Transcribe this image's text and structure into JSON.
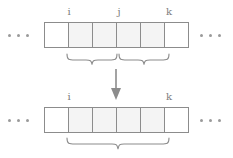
{
  "figure": {
    "stroke_color": "#8c8c8c",
    "shade_color": "#f4f4f4",
    "label_color": "#7d7d7d",
    "background": "#ffffff"
  },
  "top": {
    "ellipsis_left": "...",
    "ellipsis_right": "...",
    "labels": {
      "i": "i",
      "j": "j",
      "k": "k"
    },
    "cells": [
      {
        "shaded": false
      },
      {
        "shaded": true
      },
      {
        "shaded": true
      },
      {
        "shaded": true
      },
      {
        "shaded": true
      },
      {
        "shaded": false
      }
    ],
    "braces": [
      {
        "name": "brace-i-to-j",
        "span_cells": 2
      },
      {
        "name": "brace-j-to-k",
        "span_cells": 2
      }
    ]
  },
  "arrow": {
    "direction": "down",
    "name": "merge-arrow"
  },
  "bottom": {
    "ellipsis_left": "...",
    "ellipsis_right": "...",
    "labels": {
      "i": "i",
      "k": "k"
    },
    "cells": [
      {
        "shaded": false
      },
      {
        "shaded": true
      },
      {
        "shaded": true
      },
      {
        "shaded": true
      },
      {
        "shaded": true
      },
      {
        "shaded": false
      }
    ],
    "braces": [
      {
        "name": "brace-i-to-k",
        "span_cells": 4
      }
    ]
  }
}
